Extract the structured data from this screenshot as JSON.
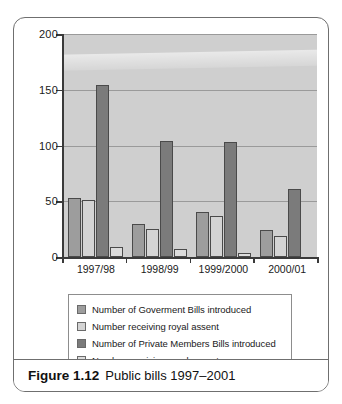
{
  "figure": {
    "caption_number": "Figure 1.12",
    "caption_text": "Public bills 1997–2001"
  },
  "chart_data": {
    "type": "bar",
    "title": "Public bills 1997–2001",
    "xlabel": "",
    "ylabel": "",
    "ylim": [
      0,
      200
    ],
    "yticks": [
      0,
      50,
      100,
      150,
      200
    ],
    "ytick_labels": [
      "0",
      "50",
      "100",
      "150",
      "200"
    ],
    "grid": true,
    "legend_position": "below",
    "categories": [
      "1997/98",
      "1998/99",
      "1999/2000",
      "2000/01"
    ],
    "series": [
      {
        "name": "Number of Goverment Bills introduced",
        "color": "#9d9d9d",
        "values": [
          53,
          30,
          40,
          24
        ]
      },
      {
        "name": "Number receiving royal assent",
        "color": "#d4d4d4",
        "values": [
          51,
          25,
          37,
          19
        ]
      },
      {
        "name": "Number of Private Members Bills introduced",
        "color": "#7b7b7b",
        "values": [
          154,
          104,
          103,
          61
        ]
      },
      {
        "name": "Number receiving royal assent",
        "color": "#dcdcdc",
        "values": [
          9,
          7,
          4,
          0
        ]
      }
    ]
  }
}
